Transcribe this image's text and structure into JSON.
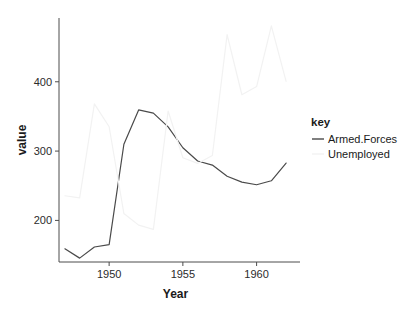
{
  "chart_data": {
    "type": "line",
    "title": "",
    "xlabel": "Year",
    "ylabel": "value",
    "xlim": [
      1946.6,
      1962.4
    ],
    "ylim": [
      140,
      492
    ],
    "grid": false,
    "legend_position": "right",
    "legend_title": "key",
    "xticks": [
      1950,
      1955,
      1960
    ],
    "xtick_labels": [
      "1950",
      "1955",
      "1960"
    ],
    "yticks": [
      200,
      300,
      400
    ],
    "ytick_labels": [
      "200",
      "300",
      "400"
    ],
    "x": [
      1947,
      1948,
      1949,
      1950,
      1951,
      1952,
      1953,
      1954,
      1955,
      1956,
      1957,
      1958,
      1959,
      1960,
      1961,
      1962
    ],
    "series": [
      {
        "name": "Armed.Forces",
        "color": "#4a4a4a",
        "values": [
          159.0,
          145.6,
          161.6,
          165.0,
          309.9,
          359.4,
          354.7,
          335.0,
          304.8,
          285.7,
          279.8,
          263.7,
          255.2,
          251.4,
          257.2,
          282.7
        ]
      },
      {
        "name": "Unemployed",
        "color": "#f2f2f2",
        "values": [
          235.6,
          232.5,
          368.2,
          335.1,
          209.9,
          193.2,
          187.0,
          357.8,
          290.4,
          282.2,
          293.6,
          468.1,
          381.3,
          393.1,
          480.6,
          400.7
        ]
      }
    ]
  },
  "axes": {
    "x_label": "Year",
    "y_label": "value"
  },
  "legend": {
    "title": "key",
    "entries": [
      {
        "label": "Armed.Forces",
        "color": "#4a4a4a"
      },
      {
        "label": "Unemployed",
        "color": "#f2f2f2"
      }
    ]
  },
  "colors": {
    "background": "#ffffff",
    "axis": "#4d4d4d",
    "text": "#1a1a1a"
  }
}
